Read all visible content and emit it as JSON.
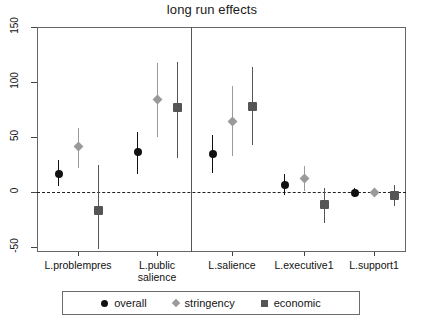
{
  "chart_data": {
    "type": "scatter",
    "title": "long run effects",
    "xlabel": "",
    "ylabel": "",
    "ylim": [
      -62,
      150
    ],
    "yticks": [
      -50,
      0,
      50,
      100,
      150
    ],
    "ytick_labels": [
      "-50",
      "0",
      "50",
      "100",
      "150"
    ],
    "grid": false,
    "zero_reference_line": 0,
    "panel_divider_after_category": "L.public salience",
    "legend_position": "bottom",
    "categories": [
      "L.problempres",
      "L.public\nsalience",
      "L.salience",
      "L.executive1",
      "L.support1"
    ],
    "category_labels": [
      [
        "L.problempres"
      ],
      [
        "L.public",
        "salience"
      ],
      [
        "L.salience"
      ],
      [
        "L.executive1"
      ],
      [
        "L.support1"
      ]
    ],
    "series": [
      {
        "name": "overall",
        "marker": "circle",
        "color": "#111111",
        "values": [
          16,
          36,
          35,
          6,
          -1
        ],
        "ci_low": [
          5,
          16,
          17,
          -3,
          -5
        ],
        "ci_high": [
          29,
          55,
          52,
          16,
          4
        ]
      },
      {
        "name": "stringency",
        "marker": "diamond",
        "color": "#9a9a9a",
        "values": [
          41,
          84,
          64,
          12,
          0
        ],
        "ci_low": [
          22,
          50,
          33,
          1,
          -4
        ],
        "ci_high": [
          58,
          117,
          96,
          24,
          4
        ]
      },
      {
        "name": "economic",
        "marker": "square",
        "color": "#555555",
        "values": [
          -17,
          77,
          78,
          -11,
          -3
        ],
        "ci_low": [
          -52,
          31,
          43,
          -28,
          -13
        ],
        "ci_high": [
          25,
          118,
          114,
          4,
          6
        ]
      }
    ],
    "colors": {
      "overall": "#111111",
      "stringency": "#9a9a9a",
      "economic": "#555555",
      "axis": "#666666",
      "background": "#ffffff"
    }
  },
  "legend": {
    "entries": [
      {
        "label": "overall",
        "marker": "circle-marker-icon",
        "color": "#111111"
      },
      {
        "label": "stringency",
        "marker": "diamond-marker-icon",
        "color": "#9a9a9a"
      },
      {
        "label": "economic",
        "marker": "square-marker-icon",
        "color": "#555555"
      }
    ]
  }
}
